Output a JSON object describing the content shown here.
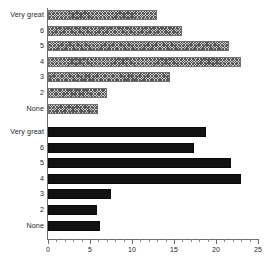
{
  "chart_data": {
    "type": "bar",
    "orientation": "horizontal",
    "title": "",
    "xlabel": "",
    "ylabel": "",
    "xlim": [
      0,
      25
    ],
    "grid": false,
    "legend_position": "none",
    "x_ticks": [
      0,
      5,
      10,
      15,
      20,
      25
    ],
    "x_tick_labels": [
      "0",
      "5",
      "10",
      "15",
      "20",
      "25"
    ],
    "minor_tick_step": 1,
    "categories": [
      "Very great",
      "6",
      "5",
      "4",
      "3",
      "2",
      "None"
    ],
    "series": [
      {
        "name": "group-1",
        "style": "hatched",
        "fill": "#cfcfcf",
        "edge": "#707070",
        "categories": [
          "Very great",
          "6",
          "5",
          "4",
          "3",
          "2",
          "None"
        ],
        "values": [
          13.0,
          16.0,
          21.5,
          23.0,
          14.5,
          7.0,
          6.0
        ]
      },
      {
        "name": "group-2",
        "style": "solid",
        "fill": "#121212",
        "edge": "#0a0a0a",
        "categories": [
          "Very great",
          "6",
          "5",
          "4",
          "3",
          "2",
          "None"
        ],
        "values": [
          18.8,
          17.4,
          21.8,
          23.0,
          7.5,
          5.8,
          6.2
        ]
      }
    ]
  }
}
